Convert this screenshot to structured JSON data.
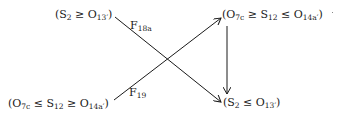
{
  "diagram": {
    "nodes": {
      "top_left": {
        "open": "(S",
        "s1": "2",
        "rel1": " ≥ O",
        "s2": "13′",
        "close": ")"
      },
      "top_right": {
        "open": "(O",
        "s1": "7c",
        "rel1": " ≥ S",
        "s2": "12",
        "rel2": " ≤ O",
        "s3": "14a′",
        "close": ")"
      },
      "bottom_left": {
        "open": "(O",
        "s1": "7c",
        "rel1": " ≤ S",
        "s2": "12",
        "rel2": " ≥ O",
        "s3": "14a′",
        "close": ")"
      },
      "bottom_right": {
        "open": "(S",
        "s1": "2",
        "rel1": " ≤ O",
        "s2": "13′",
        "close": ")"
      }
    },
    "edges": [
      {
        "from": "top_left",
        "to": "bottom_right",
        "label_main": "F",
        "label_sub": "18a"
      },
      {
        "from": "bottom_left",
        "to": "top_right",
        "label_main": "F",
        "label_sub": "19"
      },
      {
        "from": "top_right",
        "to": "bottom_right",
        "label_main": "",
        "label_sub": ""
      }
    ],
    "colors": {
      "ink": "#1a1a1a",
      "background": "#ffffff"
    }
  }
}
